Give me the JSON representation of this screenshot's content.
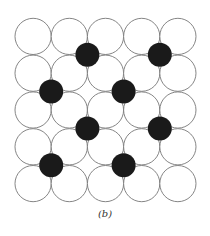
{
  "figure": {
    "caption": "(b)",
    "grid": {
      "rows": 5,
      "cols": 5,
      "origin_x": 15,
      "origin_y": 18,
      "cell_w": 36.2,
      "cell_h": 36.8,
      "stroke_color": "#777777",
      "fill_color": "#ffffff"
    },
    "interstitials": {
      "radius": 12,
      "fill_color": "#1a1a1a",
      "positions": [
        {
          "vx": 2,
          "vy": 1
        },
        {
          "vx": 4,
          "vy": 1
        },
        {
          "vx": 1,
          "vy": 2
        },
        {
          "vx": 3,
          "vy": 2
        },
        {
          "vx": 2,
          "vy": 3
        },
        {
          "vx": 4,
          "vy": 3
        },
        {
          "vx": 1,
          "vy": 4
        },
        {
          "vx": 3,
          "vy": 4
        }
      ]
    }
  }
}
